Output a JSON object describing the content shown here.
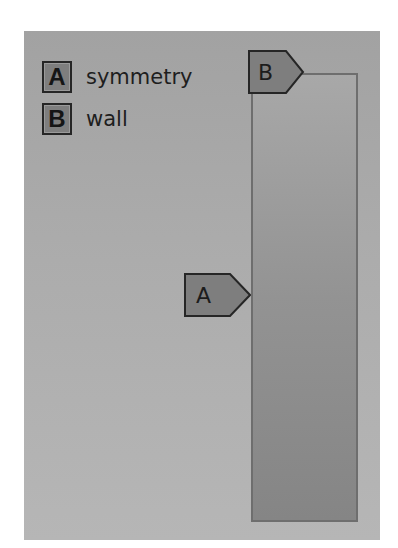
{
  "legend": {
    "items": [
      {
        "key": "A",
        "label": "symmetry"
      },
      {
        "key": "B",
        "label": "wall"
      }
    ]
  },
  "diagram": {
    "tags": [
      {
        "key": "B",
        "position": "top-left corner of domain, points right"
      },
      {
        "key": "A",
        "position": "left edge of domain midpoint, points right"
      }
    ]
  },
  "colors": {
    "panel_background": "#acacac",
    "domain_fill": "#939393",
    "tag_fill": "#7e7e7e",
    "outline": "#262626"
  }
}
